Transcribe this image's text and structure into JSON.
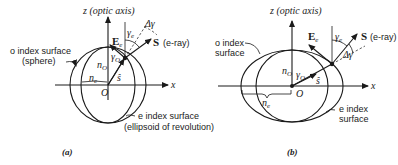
{
  "panels": [
    {
      "id": "a",
      "caption": "(a)",
      "z_axis_label": "z (optic axis)",
      "x_axis_label": "x",
      "origin_label": "O",
      "o_surface_label_1": "o index surface",
      "o_surface_label_2": "(sphere)",
      "e_surface_label_1": "e index surface",
      "e_surface_label_2": "(ellipsoid of revolution)",
      "n_o_label": "n",
      "n_o_sub": "O",
      "n_e_label": "n",
      "n_e_sub": "e",
      "gamma_o_label": "γ",
      "gamma_o_sub": "O",
      "gamma_e_label": "γ",
      "gamma_e_sub": "e",
      "delta_gamma_label": "Δγ",
      "E_label": "E",
      "E_sub": "e",
      "S_label": "S",
      "S_desc": "(e-ray)",
      "s_hat_label": "ŝ"
    },
    {
      "id": "b",
      "caption": "(b)",
      "z_axis_label": "z (optic axis)",
      "x_axis_label": "x",
      "origin_label": "O",
      "o_surface_label_1": "o index",
      "o_surface_label_2": "surface",
      "e_surface_label_1": "e index",
      "e_surface_label_2": "surface",
      "n_o_label": "n",
      "n_o_sub": "O",
      "n_e_label": "n",
      "n_e_sub": "e",
      "gamma_o_label": "γ",
      "gamma_o_sub": "O",
      "gamma_e_label": "γ",
      "gamma_e_sub": "e",
      "delta_gamma_label": "Δγ",
      "E_label": "E",
      "E_sub": "e",
      "S_label": "S",
      "S_desc": "(e-ray)",
      "s_hat_label": "ŝ"
    }
  ]
}
